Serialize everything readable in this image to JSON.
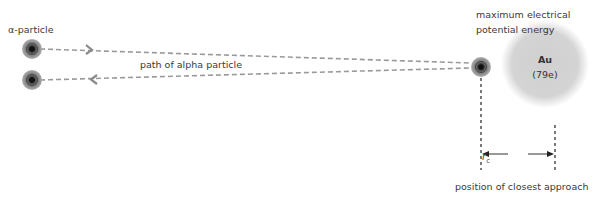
{
  "labels": {
    "alpha_particle": "α-particle",
    "path": "path of alpha particle",
    "max_energy_line1": "maximum electrical",
    "max_energy_line2": "potential energy",
    "closest_approach": "position of closest approach",
    "rc_symbol": "r",
    "rc_subscript": "c"
  },
  "nucleus": {
    "symbol": "Au",
    "charge": "(79e)"
  },
  "colors": {
    "path": "#9a9a9a",
    "nucleus": "#d3d3d3",
    "particle_outer": "#8e8e8e",
    "particle_core": "#222222"
  }
}
